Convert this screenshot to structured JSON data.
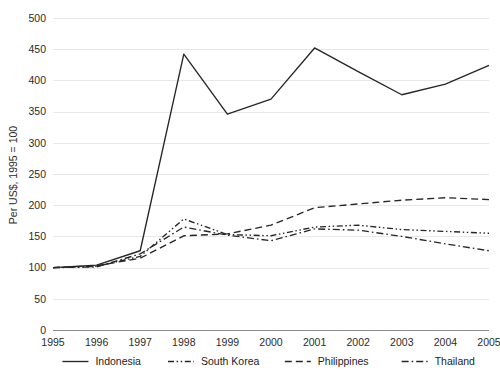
{
  "chart_data": {
    "type": "line",
    "title": "",
    "xlabel": "",
    "ylabel": "Per US$, 1995 = 100",
    "x": [
      "1995",
      "1996",
      "1997",
      "1998",
      "1999",
      "2000",
      "2001",
      "2002",
      "2003",
      "2004",
      "2005"
    ],
    "categories": [
      "1995",
      "1996",
      "1997",
      "1998",
      "1999",
      "2000",
      "2001",
      "2002",
      "2003",
      "2004",
      "2005"
    ],
    "ylim": [
      0,
      500
    ],
    "ytick_values": [
      0,
      50,
      100,
      150,
      200,
      250,
      300,
      350,
      400,
      450,
      500
    ],
    "ytick_labels": [
      "0",
      "50",
      "100",
      "150",
      "200",
      "250",
      "300",
      "350",
      "400",
      "450",
      "500"
    ],
    "grid": true,
    "legend_position": "bottom",
    "series": [
      {
        "name": "Indonesia",
        "style": "solid",
        "values": [
          100,
          104,
          127,
          442,
          346,
          370,
          452,
          414,
          377,
          394,
          424
        ]
      },
      {
        "name": "South Korea",
        "style": "dash-dot-dot",
        "values": [
          100,
          102,
          118,
          178,
          153,
          151,
          165,
          168,
          161,
          158,
          155
        ]
      },
      {
        "name": "Philippines",
        "style": "dashed",
        "values": [
          100,
          103,
          115,
          151,
          154,
          168,
          196,
          202,
          208,
          212,
          209
        ]
      },
      {
        "name": "Thailand",
        "style": "dash-dot",
        "values": [
          100,
          101,
          122,
          165,
          152,
          143,
          162,
          160,
          150,
          138,
          127
        ]
      }
    ]
  },
  "legend": {
    "items": [
      {
        "label": "Indonesia"
      },
      {
        "label": "South Korea"
      },
      {
        "label": "Philippines"
      },
      {
        "label": "Thailand"
      }
    ]
  }
}
